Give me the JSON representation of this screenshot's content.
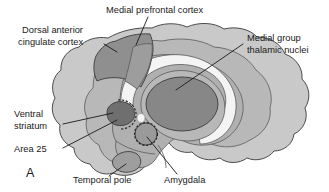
{
  "figure": {
    "panel_letter": "A",
    "background_color": "#ffffff",
    "text_color": "#1a1a1a",
    "type": "anatomical-diagram"
  },
  "palette": {
    "brain_outer_cortex": "#c9c9c9",
    "brain_mid_layer": "#b8b8b8",
    "brain_inner_layer": "#b0b0b0",
    "white_matter_band": "#f4f4f4",
    "cingulate_dark": "#8f8f8f",
    "thalamus_dark": "#878787",
    "ventral_striatum_dark": "#6f6f6f",
    "amygdala_gray": "#9a9a9a",
    "temporal_pole_gray": "#9e9e9e",
    "outline_stroke": "#3b3b3b"
  },
  "labels": [
    {
      "id": "medial-prefrontal-cortex",
      "text": "Medial prefrontal cortex",
      "lines": [
        "Medial prefrontal cortex"
      ],
      "anchor": "start",
      "x": 106,
      "y": 13,
      "leader": "M 148 17 L 136 45"
    },
    {
      "id": "dorsal-anterior-cingulate-cortex",
      "text": "Dorsal anterior cingulate cortex",
      "lines": [
        "Dorsal anterior",
        "cingulate cortex"
      ],
      "anchor": "start",
      "x": 22,
      "y": 33,
      "leader": "M 104 44 L 117 52"
    },
    {
      "id": "medial-group-thalamic-nuclei",
      "text": "Medial group thalamic nuclei",
      "lines": [
        "Medial group",
        "thalamic nuclei"
      ],
      "anchor": "start",
      "x": 247,
      "y": 41,
      "leader": "M 243 44 L 176 90"
    },
    {
      "id": "ventral-striatum",
      "text": "Ventral striatum",
      "lines": [
        "Ventral",
        "striatum"
      ],
      "anchor": "start",
      "x": 14,
      "y": 117,
      "leader": "M 63 124 L 113 113"
    },
    {
      "id": "area-25",
      "text": "Area 25",
      "lines": [
        "Area 25"
      ],
      "anchor": "start",
      "x": 14,
      "y": 152,
      "leader": "M 63 148 L 117 120"
    },
    {
      "id": "temporal-pole",
      "text": "Temporal pole",
      "lines": [
        "Temporal pole"
      ],
      "anchor": "start",
      "x": 73,
      "y": 183,
      "leader": "M 109 176 L 126 164"
    },
    {
      "id": "amygdala",
      "text": "Amygdala",
      "lines": [
        "Amygdala"
      ],
      "anchor": "start",
      "x": 164,
      "y": 183,
      "leader": "M 177 174 L 147 137"
    }
  ],
  "structures": [
    {
      "id": "brain-outline",
      "name": "cerebral-cortex-outline"
    },
    {
      "id": "cingulate-wedge",
      "name": "dorsal-anterior-cingulate-cortex-region"
    },
    {
      "id": "corpus-callosum-band",
      "name": "white-matter-band"
    },
    {
      "id": "thalamus-ellipse",
      "name": "medial-group-thalamic-nuclei-region"
    },
    {
      "id": "ventral-striatum-shape",
      "name": "ventral-striatum-region"
    },
    {
      "id": "amygdala-circle",
      "name": "amygdala-region"
    },
    {
      "id": "temporal-pole-shape",
      "name": "temporal-pole-region"
    }
  ]
}
